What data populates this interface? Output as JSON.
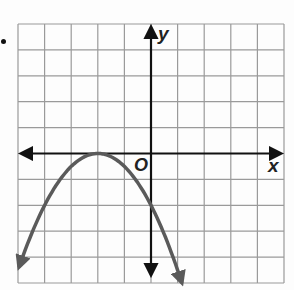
{
  "marker": "•",
  "chart_data": {
    "type": "line",
    "title": "",
    "xlabel": "x",
    "ylabel": "y",
    "origin_label": "O",
    "grid": true,
    "xlim": [
      -5,
      5
    ],
    "ylim": [
      -5,
      5
    ],
    "grid_step": 1,
    "series": [
      {
        "name": "parabola",
        "equation": "y = -1/2 (x + 2)^2",
        "vertex": [
          -2,
          0
        ],
        "color": "#5a5a5a",
        "x": [
          -5,
          -4,
          -3,
          -2,
          -1,
          0,
          1
        ],
        "values": [
          -4.5,
          -2,
          -0.5,
          0,
          -0.5,
          -2,
          -4.5
        ],
        "arrows": "both ends"
      }
    ],
    "colors": {
      "grid": "#9a9a9a",
      "axes": "#111111",
      "curve": "#5a5a5a"
    }
  }
}
